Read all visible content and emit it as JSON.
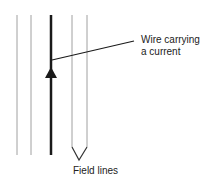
{
  "diagram": {
    "labels": {
      "wire": [
        "Wire carrying",
        "a current"
      ],
      "field": "Field lines"
    },
    "colors": {
      "wire": "#1a1a1a",
      "field_line": "#9a9a9a",
      "text": "#222222",
      "background": "#ffffff"
    },
    "elements": {
      "field_lines_x": [
        17,
        31,
        72,
        87
      ],
      "wire_x": 51,
      "direction": "up"
    }
  }
}
